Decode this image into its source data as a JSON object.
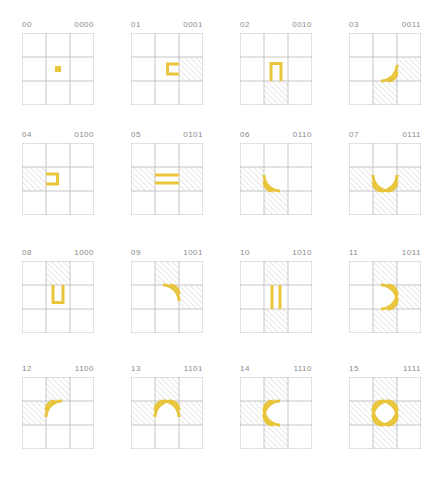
{
  "colors": {
    "accent": "#e8c53a",
    "grid": "#b8b8b8",
    "hatch": "#cfcfcf",
    "label": "#8a8a8a"
  },
  "bit_order": [
    "top",
    "left",
    "bottom",
    "right"
  ],
  "tiles": [
    {
      "index": "00",
      "bits": "0000"
    },
    {
      "index": "01",
      "bits": "0001"
    },
    {
      "index": "02",
      "bits": "0010"
    },
    {
      "index": "03",
      "bits": "0011"
    },
    {
      "index": "04",
      "bits": "0100"
    },
    {
      "index": "05",
      "bits": "0101"
    },
    {
      "index": "06",
      "bits": "0110"
    },
    {
      "index": "07",
      "bits": "0111"
    },
    {
      "index": "08",
      "bits": "1000"
    },
    {
      "index": "09",
      "bits": "1001"
    },
    {
      "index": "10",
      "bits": "1010"
    },
    {
      "index": "11",
      "bits": "1011"
    },
    {
      "index": "12",
      "bits": "1100"
    },
    {
      "index": "13",
      "bits": "1101"
    },
    {
      "index": "14",
      "bits": "1110"
    },
    {
      "index": "15",
      "bits": "1111"
    }
  ]
}
